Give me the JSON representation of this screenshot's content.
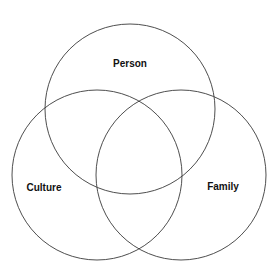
{
  "diagram": {
    "type": "venn",
    "sets": [
      {
        "label": "Person",
        "cx": 130,
        "cy": 109,
        "r": 85,
        "label_x": 130,
        "label_y": 67
      },
      {
        "label": "Culture",
        "cx": 97,
        "cy": 175,
        "r": 85,
        "label_x": 44,
        "label_y": 191
      },
      {
        "label": "Family",
        "cx": 181,
        "cy": 175,
        "r": 85,
        "label_x": 223,
        "label_y": 190
      }
    ],
    "stroke_color": "#3a3a3a",
    "background": "#ffffff"
  }
}
